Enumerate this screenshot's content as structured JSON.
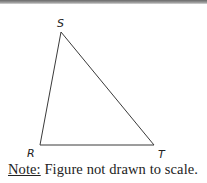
{
  "figure": {
    "type": "triangle",
    "vertices": [
      {
        "label": "S",
        "x": 61,
        "y": 32,
        "label_x": 57,
        "label_y": 27
      },
      {
        "label": "R",
        "x": 40,
        "y": 145,
        "label_x": 27,
        "label_y": 157
      },
      {
        "label": "T",
        "x": 154,
        "y": 145,
        "label_x": 158,
        "label_y": 158
      }
    ],
    "stroke_color": "#3a3a3a"
  },
  "caption": {
    "note_label": "Note:",
    "text": " Figure not drawn to scale."
  }
}
